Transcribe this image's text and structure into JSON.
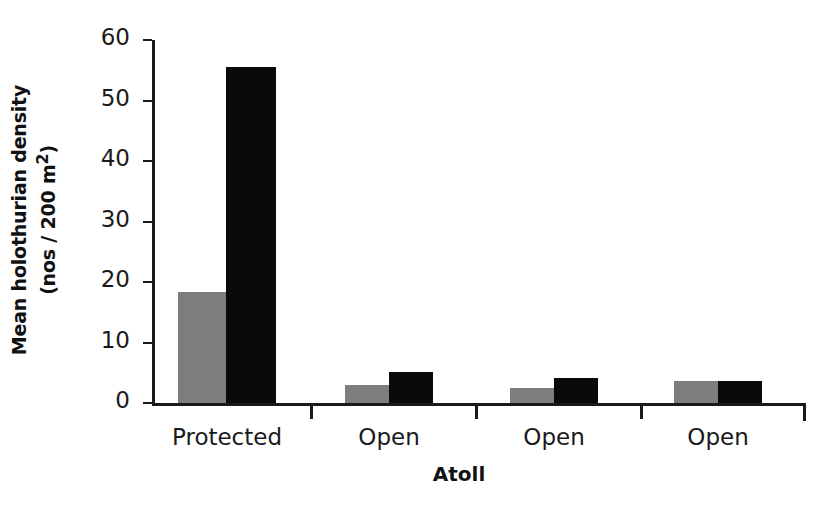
{
  "chart_data": {
    "type": "bar",
    "title": "",
    "xlabel": "Atoll",
    "ylabel": "Mean holothurian density (nos / 200 m2)",
    "ylabel_line1": "Mean holothurian density",
    "ylabel_line2_pre": "(nos / 200 m",
    "ylabel_line2_sup": "2",
    "ylabel_line2_post": ")",
    "categories": [
      "Protected",
      "Open",
      "Open",
      "Open"
    ],
    "series": [
      {
        "name": "series-gray",
        "color": "#7d7d7d",
        "values": [
          18.4,
          2.9,
          2.4,
          3.6
        ]
      },
      {
        "name": "series-black",
        "color": "#0a0a0a",
        "values": [
          55.5,
          5.2,
          4.1,
          3.7
        ]
      }
    ],
    "ylim": [
      0,
      60
    ],
    "yticks": [
      0,
      10,
      20,
      30,
      40,
      50,
      60
    ],
    "ytick_labels": [
      "0",
      "10",
      "20",
      "30",
      "40",
      "50",
      "60"
    ],
    "grid": false,
    "legend": "none"
  }
}
